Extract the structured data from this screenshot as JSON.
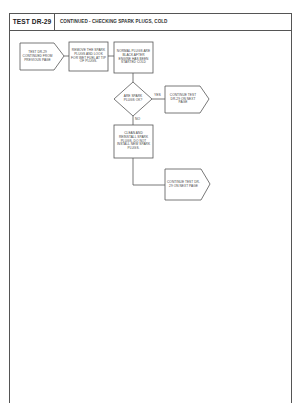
{
  "header": {
    "test_id": "TEST DR-29",
    "title": "CONTINUED - CHECKING SPARK PLUGS, COLD"
  },
  "flowchart": {
    "nodes": {
      "start": {
        "shape": "pentagon-arrow",
        "text": "TEST DR-29 CONTINUED FROM PREVIOUS PAGE"
      },
      "remove_plugs": {
        "shape": "rectangle",
        "text": "REMOVE THE SPARK PLUGS AND LOOK FOR WET FUEL AT TIP OF PLUGS."
      },
      "normal_plugs": {
        "shape": "rectangle",
        "text": "NORMAL PLUGS ARE BLACK AFTER ENGINE HAS BEEN STARTED COLD"
      },
      "decision": {
        "shape": "diamond",
        "text": "ARE SPARK PLUGS OK?"
      },
      "continue_yes": {
        "shape": "pentagon-arrow",
        "text": "CONTINUE TEST DR-29 ON NEXT PAGE"
      },
      "clean_reinstall": {
        "shape": "rectangle",
        "text": "CLEAN AND REINSTALL SPARK PLUGS. DO NOT INSTALL NEW SPARK PLUGS."
      },
      "continue_no": {
        "shape": "pentagon-arrow",
        "text": "CONTINUE TEST DR-29 ON NEXT PAGE"
      }
    },
    "edges": {
      "yes_label": "YES",
      "no_label": "NO"
    }
  },
  "colors": {
    "line": "#555555",
    "text": "#333333",
    "background": "#ffffff"
  }
}
